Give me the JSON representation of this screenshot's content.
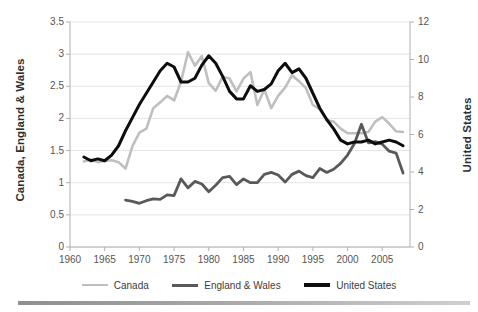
{
  "chart_data": {
    "type": "line",
    "title": "",
    "xlabel": "",
    "ylabel": "Canada, England & Wales",
    "ylabel_secondary": "United States",
    "xlim": [
      1960,
      2009
    ],
    "ylim": [
      0,
      3.5
    ],
    "ylim_secondary": [
      0,
      12
    ],
    "grid": true,
    "legend_position": "bottom",
    "xticks": [
      1960,
      1965,
      1970,
      1975,
      1980,
      1985,
      1990,
      1995,
      2000,
      2005
    ],
    "yticks_left": [
      0,
      0.5,
      1,
      1.5,
      2,
      2.5,
      3,
      3.5
    ],
    "yticks_right": [
      0,
      2,
      4,
      6,
      8,
      10,
      12
    ],
    "colors": {
      "canada": "#bfbfbf",
      "england_wales": "#595959",
      "united_states": "#0d0d0d",
      "grid": "#e4e4e4",
      "axis": "#b0b0b0",
      "text": "#555555"
    },
    "series": [
      {
        "name": "Canada",
        "axis": "left",
        "color": "#bfbfbf",
        "width": 2.6,
        "x": [
          1962,
          1963,
          1964,
          1965,
          1966,
          1967,
          1968,
          1969,
          1970,
          1971,
          1972,
          1973,
          1974,
          1975,
          1976,
          1977,
          1978,
          1979,
          1980,
          1981,
          1982,
          1983,
          1984,
          1985,
          1986,
          1987,
          1988,
          1989,
          1990,
          1991,
          1992,
          1993,
          1994,
          1995,
          1996,
          1997,
          1998,
          1999,
          2000,
          2001,
          2002,
          2003,
          2004,
          2005,
          2006,
          2007,
          2008
        ],
        "values": [
          1.33,
          1.36,
          1.32,
          1.34,
          1.35,
          1.32,
          1.22,
          1.57,
          1.78,
          1.84,
          2.16,
          2.25,
          2.35,
          2.28,
          2.57,
          3.03,
          2.82,
          2.97,
          2.55,
          2.43,
          2.65,
          2.62,
          2.42,
          2.62,
          2.72,
          2.21,
          2.45,
          2.16,
          2.35,
          2.48,
          2.67,
          2.58,
          2.47,
          2.21,
          2.14,
          1.97,
          1.95,
          1.84,
          1.77,
          1.77,
          1.77,
          1.79,
          1.95,
          2.02,
          1.92,
          1.8,
          1.79
        ]
      },
      {
        "name": "England & Wales",
        "axis": "left",
        "color": "#595959",
        "width": 2.8,
        "x": [
          1968,
          1969,
          1970,
          1971,
          1972,
          1973,
          1974,
          1975,
          1976,
          1977,
          1978,
          1979,
          1980,
          1981,
          1982,
          1983,
          1984,
          1985,
          1986,
          1987,
          1988,
          1989,
          1990,
          1991,
          1992,
          1993,
          1994,
          1995,
          1996,
          1997,
          1998,
          1999,
          2000,
          2001,
          2002,
          2003,
          2004,
          2005,
          2006,
          2007,
          2008
        ],
        "values": [
          0.73,
          0.71,
          0.68,
          0.72,
          0.75,
          0.74,
          0.81,
          0.8,
          1.06,
          0.92,
          1.02,
          0.98,
          0.86,
          0.96,
          1.08,
          1.1,
          0.97,
          1.06,
          1.0,
          1.0,
          1.13,
          1.16,
          1.12,
          1.01,
          1.13,
          1.18,
          1.11,
          1.08,
          1.22,
          1.16,
          1.21,
          1.3,
          1.43,
          1.61,
          1.91,
          1.62,
          1.64,
          1.6,
          1.49,
          1.46,
          1.15
        ]
      },
      {
        "name": "United States",
        "axis": "right",
        "color": "#0d0d0d",
        "width": 3.0,
        "x": [
          1962,
          1963,
          1964,
          1965,
          1966,
          1967,
          1968,
          1969,
          1970,
          1971,
          1972,
          1973,
          1974,
          1975,
          1976,
          1977,
          1978,
          1979,
          1980,
          1981,
          1982,
          1983,
          1984,
          1985,
          1986,
          1987,
          1988,
          1989,
          1990,
          1991,
          1992,
          1993,
          1994,
          1995,
          1996,
          1997,
          1998,
          1999,
          2000,
          2001,
          2002,
          2003,
          2004,
          2005,
          2006,
          2007,
          2008
        ],
        "values": [
          4.8,
          4.6,
          4.7,
          4.6,
          4.9,
          5.4,
          6.2,
          6.9,
          7.6,
          8.2,
          8.8,
          9.4,
          9.8,
          9.6,
          8.8,
          8.8,
          9.0,
          9.7,
          10.2,
          9.8,
          9.1,
          8.3,
          7.9,
          7.9,
          8.6,
          8.3,
          8.4,
          8.7,
          9.4,
          9.8,
          9.3,
          9.5,
          9.0,
          8.2,
          7.4,
          6.8,
          6.3,
          5.7,
          5.5,
          5.6,
          5.6,
          5.7,
          5.5,
          5.6,
          5.7,
          5.6,
          5.4
        ]
      }
    ]
  },
  "legend": {
    "items": [
      {
        "label": "Canada",
        "color": "#bfbfbf"
      },
      {
        "label": "England & Wales",
        "color": "#595959"
      },
      {
        "label": "United States",
        "color": "#0d0d0d"
      }
    ]
  },
  "axes": {
    "left_title": "Canada, England & Wales",
    "right_title": "United States",
    "left_ticks": [
      "3.5",
      "3",
      "2.5",
      "2",
      "1.5",
      "1",
      "0.5",
      "0"
    ],
    "right_ticks": [
      "12",
      "10",
      "8",
      "6",
      "4",
      "2",
      "0"
    ],
    "x_ticks": [
      "1960",
      "1965",
      "1970",
      "1975",
      "1980",
      "1985",
      "1990",
      "1995",
      "2000",
      "2005"
    ]
  }
}
